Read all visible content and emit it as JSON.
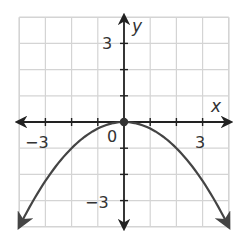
{
  "chart_data": {
    "type": "line",
    "title": "",
    "xlabel": "x",
    "ylabel": "y",
    "xlim": [
      -4,
      4
    ],
    "ylim": [
      -4,
      4
    ],
    "grid": true,
    "x_tick_labels": [
      {
        "value": -3,
        "label": "−3"
      },
      {
        "value": 3,
        "label": "3"
      }
    ],
    "y_tick_labels": [
      {
        "value": 3,
        "label": "3"
      },
      {
        "value": -3,
        "label": "−3"
      }
    ],
    "origin_label": "0",
    "series": [
      {
        "name": "y = -0.25x^2",
        "equation": "y = -(1/4)x^2",
        "x": [
          -4,
          -3,
          -2,
          -1,
          0,
          1,
          2,
          3,
          4
        ],
        "values": [
          -4,
          -2.25,
          -1,
          -0.25,
          0,
          -0.25,
          -1,
          -2.25,
          -4
        ],
        "arrows_at_ends": true
      }
    ],
    "points": [
      {
        "x": 0,
        "y": 0,
        "label": "vertex"
      }
    ],
    "legend": null
  },
  "labels": {
    "x_axis": "x",
    "y_axis": "y",
    "origin": "0",
    "x_neg3": "−3",
    "x_pos3": "3",
    "y_pos3": "3",
    "y_neg3": "−3"
  }
}
